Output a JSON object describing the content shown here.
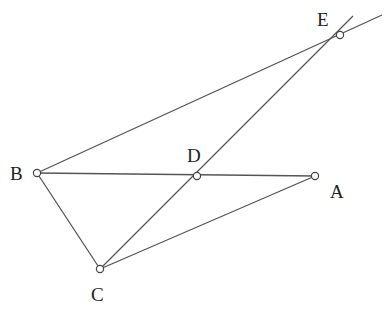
{
  "diagram": {
    "type": "geometry-figure",
    "points": {
      "A": {
        "label": "A",
        "x": 315,
        "y": 176,
        "lx": 330,
        "ly": 198
      },
      "B": {
        "label": "B",
        "x": 37,
        "y": 173,
        "lx": 10,
        "ly": 180
      },
      "C": {
        "label": "C",
        "x": 100,
        "y": 269,
        "lx": 91,
        "ly": 301
      },
      "D": {
        "label": "D",
        "x": 197,
        "y": 176,
        "lx": 187,
        "ly": 162
      },
      "E": {
        "label": "E",
        "x": 340,
        "y": 35,
        "lx": 317,
        "ly": 26
      }
    },
    "segments": [
      {
        "from": "B",
        "to": "A",
        "name": "segment-BA"
      },
      {
        "from": "B",
        "to": "C",
        "name": "segment-BC"
      },
      {
        "from": "C",
        "to": "A",
        "name": "segment-CA"
      },
      {
        "from": "C",
        "to": "E",
        "name": "segment-CE",
        "extends_past_end": true
      },
      {
        "from": "B",
        "to": "E",
        "name": "segment-BE",
        "extends_past_end": true
      }
    ],
    "colors": {
      "line": "#555555",
      "point_fill": "#ffffff",
      "label": "#222222"
    }
  }
}
